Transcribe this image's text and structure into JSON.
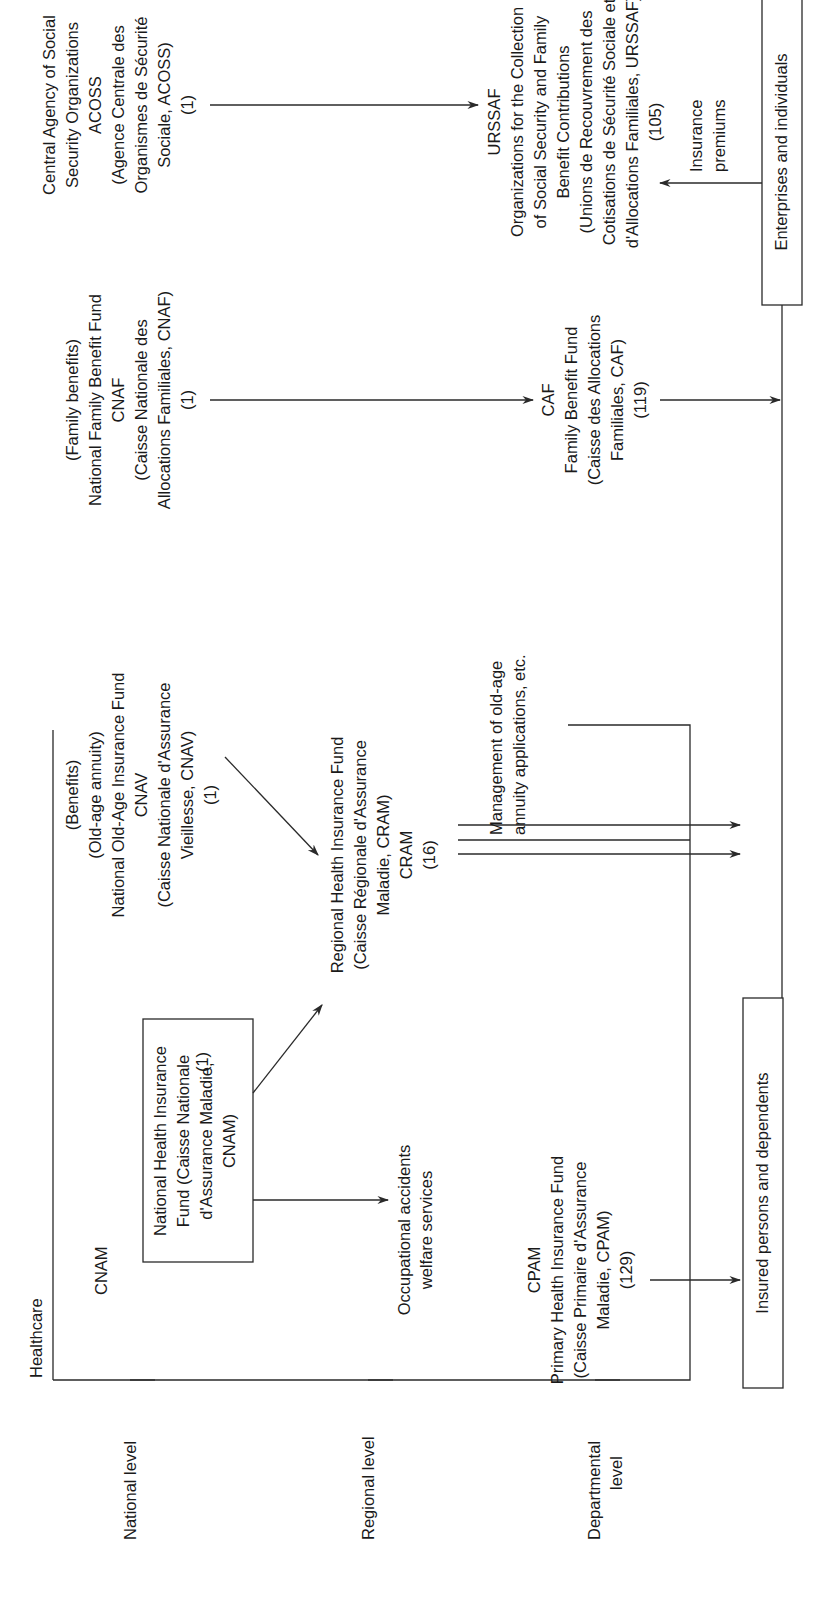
{
  "diagram": {
    "orientation": "rotated 90 degrees counter-clockwise",
    "levels": [
      {
        "label": "National level"
      },
      {
        "label": "Regional level"
      },
      {
        "label": "Departmental",
        "label2": "level"
      }
    ],
    "healthcare": {
      "title": "Healthcare",
      "cnam_label": "CNAM",
      "cnam_box": [
        "National Health Insurance",
        "Fund (Caisse Nationale",
        "d'Assurance Maladie,",
        "CNAM)"
      ],
      "cnam_count": "(1)",
      "occupational": [
        "Occupational accidents",
        "welfare services"
      ],
      "cram": [
        "Regional Health Insurance Fund",
        "(Caisse Régionale d'Assurance",
        "Maladie, CRAM)",
        "CRAM",
        "(16)"
      ],
      "cpam": [
        "CPAM",
        "Primary Health Insurance Fund",
        "(Caisse Primaire d'Assurance",
        "Maladie, CPAM)",
        "(129)"
      ]
    },
    "cnav": [
      "(Benefits)",
      "(Old-age annuity)",
      "National Old-Age Insurance Fund",
      "CNAV",
      "(Caisse Nationale d'Assurance",
      "Vieillesse, CNAV)",
      "(1)"
    ],
    "old_age_mgmt": [
      "Management of old-age",
      "annuity applications, etc."
    ],
    "cnaf": [
      "(Family benefits)",
      "National Family Benefit Fund",
      "CNAF",
      "(Caisse Nationale des",
      "Allocations Familiales, CNAF)",
      "(1)"
    ],
    "caf": [
      "CAF",
      "Family Benefit Fund",
      "(Caisse des Allocations",
      "Familiales, CAF)",
      "(119)"
    ],
    "acoss": [
      "Central Agency of Social",
      "Security Organizations",
      "ACOSS",
      "(Agence Centrale des",
      "Organismes de Sécurité",
      "Sociale, ACOSS)",
      "(1)"
    ],
    "urssaf": [
      "URSSAF",
      "Organizations for the Collection",
      "of Social Security and Family",
      "Benefit Contributions",
      "(Unions de Recouvrement des",
      "Cotisations de Sécurité Sociale et",
      "d'Allocations Familiales, URSSAF)",
      "(105)"
    ],
    "insurance_premiums": [
      "Insurance",
      "premiums"
    ],
    "insured_box": "Insured persons and dependents",
    "enterprises_box": "Enterprises and individuals",
    "colors": {
      "line": "#2a2a2a",
      "text": "#1a1a1a",
      "background": "#ffffff"
    }
  }
}
